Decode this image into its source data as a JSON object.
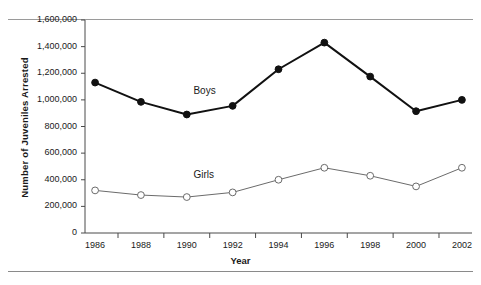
{
  "figure": {
    "background": "#ffffff",
    "ink": "#1a1a1a"
  },
  "chart_data": {
    "type": "line",
    "title": "",
    "xlabel": "Year",
    "ylabel": "Number of Juveniles Arrested",
    "x": [
      1986,
      1988,
      1990,
      1992,
      1994,
      1996,
      1998,
      2000,
      2002
    ],
    "categories": [
      "1986",
      "1988",
      "1990",
      "1992",
      "1994",
      "1996",
      "1998",
      "2000",
      "2002"
    ],
    "xlim": [
      1985,
      2003
    ],
    "ylim": [
      0,
      1600000
    ],
    "grid": false,
    "legend": "inline-labels",
    "y_ticks": [
      0,
      200000,
      400000,
      600000,
      800000,
      1000000,
      1200000,
      1400000,
      1600000
    ],
    "y_tick_labels": [
      "0",
      "200,000",
      "400,000",
      "600,000",
      "800,000",
      "1,000,000",
      "1,200,000",
      "1,400,000",
      "1,600,000"
    ],
    "x_tick_labels": [
      "1986",
      "1988",
      "1990",
      "1992",
      "1994",
      "1996",
      "1998",
      "2000",
      "2002"
    ],
    "series": [
      {
        "name": "Boys",
        "marker": "filled-circle",
        "color": "#111111",
        "linewidth": 2,
        "values": [
          1130000,
          985000,
          890000,
          955000,
          1230000,
          1430000,
          1175000,
          915000,
          1000000
        ]
      },
      {
        "name": "Girls",
        "marker": "open-circle",
        "color": "#6b6b6b",
        "linewidth": 1,
        "values": [
          320000,
          285000,
          270000,
          305000,
          400000,
          490000,
          430000,
          350000,
          490000
        ]
      }
    ],
    "annotations": [
      {
        "text": "Boys",
        "x": 1990.9,
        "y": 1060000
      },
      {
        "text": "Girls",
        "x": 1990.9,
        "y": 430000
      }
    ]
  }
}
